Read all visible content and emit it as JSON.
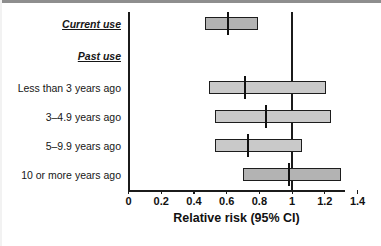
{
  "chart_data": {
    "type": "bar",
    "subtype": "forest-plot",
    "title": "",
    "xlabel": "Relative risk (95% CI)",
    "ylabel": "",
    "xlim": [
      0,
      1.4
    ],
    "xticks": [
      "0",
      "0.2",
      "0.4",
      "0.6",
      "0.8",
      "1",
      "1.2",
      "1.4"
    ],
    "xtick_values": [
      0,
      0.2,
      0.4,
      0.6,
      0.8,
      1,
      1.2,
      1.4
    ],
    "grid": false,
    "legend": "none",
    "reference_line": 1.0,
    "categories": [
      "Current use",
      "Past use",
      "Less than 3 years ago",
      "3–4.9 years ago",
      "5–9.9 years ago",
      "10 or more years ago"
    ],
    "rows": [
      {
        "label": "Current use",
        "is_header": true,
        "emphasis": true,
        "has_bar": true,
        "estimate": 0.61,
        "ci_low": 0.47,
        "ci_high": 0.79
      },
      {
        "label": "Past use",
        "is_header": true,
        "emphasis": true,
        "has_bar": false,
        "estimate": null,
        "ci_low": null,
        "ci_high": null
      },
      {
        "label": "Less than 3 years ago",
        "is_header": false,
        "emphasis": false,
        "has_bar": true,
        "estimate": 0.71,
        "ci_low": 0.49,
        "ci_high": 1.21
      },
      {
        "label": "3–4.9 years ago",
        "is_header": false,
        "emphasis": false,
        "has_bar": true,
        "estimate": 0.84,
        "ci_low": 0.53,
        "ci_high": 1.24
      },
      {
        "label": "5–9.9 years ago",
        "is_header": false,
        "emphasis": false,
        "has_bar": true,
        "estimate": 0.73,
        "ci_low": 0.53,
        "ci_high": 1.06
      },
      {
        "label": "10 or more years ago",
        "is_header": false,
        "emphasis": false,
        "has_bar": true,
        "estimate": 0.98,
        "ci_low": 0.7,
        "ci_high": 1.3
      }
    ],
    "values": [
      0.61,
      null,
      0.71,
      0.84,
      0.73,
      0.98
    ],
    "ci_low": [
      0.47,
      null,
      0.49,
      0.53,
      0.53,
      0.7
    ],
    "ci_high": [
      0.79,
      null,
      1.21,
      1.24,
      1.06,
      1.3
    ],
    "colors": {
      "bar_fill": "#c9c9c9",
      "bar_fill_dark": "#b3b3b3",
      "bar_stroke": "#1d1d1d",
      "axis": "#1b1b1b",
      "text": "#111111",
      "background": "#ffffff"
    }
  },
  "labels": {
    "row0": "Current use",
    "row1": "Past use",
    "row2": "Less than 3 years ago",
    "row3": "3–4.9 years ago",
    "row4": "5–9.9 years ago",
    "row5": "10 or more years ago"
  },
  "ticks": {
    "t0": "0",
    "t1": "0.2",
    "t2": "0.4",
    "t3": "0.6",
    "t4": "0.8",
    "t5": "1",
    "t6": "1.2",
    "t7": "1.4"
  },
  "axis": {
    "x_title": "Relative risk (95% CI)"
  }
}
